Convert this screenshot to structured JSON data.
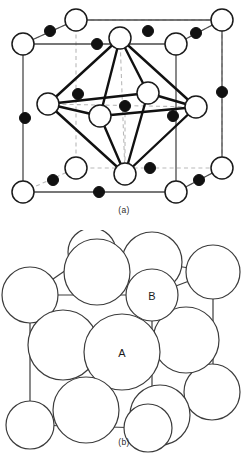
{
  "figure": {
    "panels": [
      {
        "id": "a",
        "caption": "(a)",
        "type": "ball-and-stick-unit-cell",
        "description": "Cubic unit cell with large open circles and small filled circles, octahedral coordination polyhedron drawn with heavy bonds"
      },
      {
        "id": "b",
        "caption": "(b)",
        "type": "space-filling-model",
        "description": "Close-packed sphere model of the same cell",
        "labels": [
          {
            "text": "A",
            "role": "large-ion-label"
          },
          {
            "text": "B",
            "role": "small-ion-label"
          }
        ]
      }
    ]
  },
  "colors": {
    "background": "#ffffff",
    "outline": "#1a1a1a",
    "filled_atom": "#111111",
    "open_atom_fill": "#ffffff",
    "cell_edge": "#4a4a4a",
    "hidden_edge": "#b9b9b9",
    "bond": "#111111",
    "sphere_outline": "#3c3c3c",
    "sphere_fill": "#ffffff",
    "caption_text": "#2b2b2b"
  },
  "geometry": {
    "panel_a": {
      "open_atoms": [
        {
          "x": 23,
          "y": 44,
          "r": 11,
          "site": "back-top-left"
        },
        {
          "x": 76,
          "y": 20,
          "r": 11,
          "site": "top-back-edge"
        },
        {
          "x": 222,
          "y": 20,
          "r": 11,
          "site": "back-top-right"
        },
        {
          "x": 176,
          "y": 44,
          "r": 11,
          "site": "top-front-right"
        },
        {
          "x": 120,
          "y": 38,
          "r": 11,
          "site": "top-face-center"
        },
        {
          "x": 48,
          "y": 104,
          "r": 11,
          "site": "left-face-center"
        },
        {
          "x": 196,
          "y": 107,
          "r": 11,
          "site": "right-face-center"
        },
        {
          "x": 100,
          "y": 116,
          "r": 11,
          "site": "front-face-center"
        },
        {
          "x": 148,
          "y": 93,
          "r": 11,
          "site": "back-face-center"
        },
        {
          "x": 23,
          "y": 192,
          "r": 11,
          "site": "front-bottom-left"
        },
        {
          "x": 76,
          "y": 168,
          "r": 11,
          "site": "bottom-back-left"
        },
        {
          "x": 125,
          "y": 174,
          "r": 11,
          "site": "bottom-face-center"
        },
        {
          "x": 176,
          "y": 192,
          "r": 11,
          "site": "front-bottom-right"
        },
        {
          "x": 222,
          "y": 168,
          "r": 11,
          "site": "bottom-back-right"
        }
      ],
      "filled_atoms": [
        {
          "x": 50,
          "y": 31,
          "r": 5.5,
          "site": "top-back-left-edge"
        },
        {
          "x": 148,
          "y": 31,
          "r": 5.5,
          "site": "top-back-right-edge"
        },
        {
          "x": 97,
          "y": 44,
          "r": 5.5,
          "site": "top-front-left-edge"
        },
        {
          "x": 196,
          "y": 33,
          "r": 5.5,
          "site": "top-right-edge"
        },
        {
          "x": 25,
          "y": 118,
          "r": 5.5,
          "site": "left-vertical-edge"
        },
        {
          "x": 78,
          "y": 94,
          "r": 5.5,
          "site": "interior-left"
        },
        {
          "x": 125,
          "y": 106,
          "r": 5.5,
          "site": "body-center"
        },
        {
          "x": 173,
          "y": 116,
          "r": 5.5,
          "site": "interior-right"
        },
        {
          "x": 222,
          "y": 92,
          "r": 5.5,
          "site": "right-vertical-edge"
        },
        {
          "x": 53,
          "y": 180,
          "r": 5.5,
          "site": "bottom-left-edge"
        },
        {
          "x": 99,
          "y": 192,
          "r": 5.5,
          "site": "bottom-front-edge"
        },
        {
          "x": 150,
          "y": 168,
          "r": 5.5,
          "site": "bottom-back-edge"
        },
        {
          "x": 152,
          "y": 180,
          "r": 5.5,
          "site": "bottom-right-edge"
        },
        {
          "x": 199,
          "y": 180,
          "r": 5.5,
          "site": "bottom-right-corner-edge"
        }
      ],
      "octahedron_vertices": [
        {
          "x": 120,
          "y": 38,
          "label": "top-apex"
        },
        {
          "x": 125,
          "y": 174,
          "label": "bottom-apex"
        },
        {
          "x": 48,
          "y": 104,
          "label": "left"
        },
        {
          "x": 196,
          "y": 107,
          "label": "right"
        },
        {
          "x": 100,
          "y": 116,
          "label": "front"
        },
        {
          "x": 148,
          "y": 93,
          "label": "back"
        }
      ]
    },
    "panel_b": {
      "large_spheres": [
        {
          "x": 30,
          "y": 295,
          "r": 28
        },
        {
          "x": 97,
          "y": 272,
          "r": 33
        },
        {
          "x": 152,
          "y": 262,
          "r": 30
        },
        {
          "x": 63,
          "y": 345,
          "r": 35
        },
        {
          "x": 122,
          "y": 352,
          "r": 38
        },
        {
          "x": 186,
          "y": 340,
          "r": 33
        },
        {
          "x": 86,
          "y": 410,
          "r": 33
        },
        {
          "x": 160,
          "y": 415,
          "r": 30
        },
        {
          "x": 212,
          "y": 392,
          "r": 28
        }
      ],
      "small_spheres": [
        {
          "x": 30,
          "y": 425,
          "r": 24
        },
        {
          "x": 148,
          "y": 428,
          "r": 24
        },
        {
          "x": 213,
          "y": 272,
          "r": 27
        },
        {
          "x": 92,
          "y": 252,
          "r": 24
        },
        {
          "x": 152,
          "y": 295,
          "r": 26
        }
      ],
      "labels": [
        {
          "text": "A",
          "x": 122,
          "y": 357
        },
        {
          "text": "B",
          "x": 152,
          "y": 300
        }
      ]
    }
  }
}
